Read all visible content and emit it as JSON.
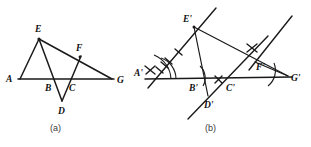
{
  "figure": {
    "background_color": "#ffffff",
    "ink_color": "#1a1a1a",
    "panels": [
      {
        "id": "panel-a",
        "caption": "(a)",
        "caption_x": 57,
        "caption_y": 131,
        "points": [
          {
            "name": "A",
            "label": "A",
            "x": 20,
            "y": 79,
            "label_x": 6,
            "label_y": 82
          },
          {
            "name": "B",
            "label": "B",
            "x": 51,
            "y": 79,
            "label_x": 45,
            "label_y": 91
          },
          {
            "name": "C",
            "label": "C",
            "x": 74,
            "y": 79,
            "label_x": 69,
            "label_y": 91
          },
          {
            "name": "D",
            "label": "D",
            "x": 62,
            "y": 100,
            "label_x": 58,
            "label_y": 114
          },
          {
            "name": "E",
            "label": "E",
            "x": 39,
            "y": 39,
            "label_x": 35,
            "label_y": 32
          },
          {
            "name": "F",
            "label": "F",
            "x": 80,
            "y": 57,
            "label_x": 76,
            "label_y": 51
          },
          {
            "name": "G",
            "label": "G",
            "x": 112,
            "y": 79,
            "label_x": 117,
            "label_y": 83
          }
        ],
        "segments": [
          {
            "name": "A-E",
            "from": "A",
            "to": "E"
          },
          {
            "name": "A-G",
            "from": "A",
            "to": "G"
          },
          {
            "name": "E-G",
            "from": "E",
            "to": "G"
          },
          {
            "name": "E-D",
            "from": "E",
            "to": "D"
          },
          {
            "name": "D-F",
            "from": "D",
            "to": "F"
          }
        ]
      },
      {
        "id": "panel-b",
        "caption": "(b)",
        "caption_x": 212,
        "caption_y": 131,
        "points": [
          {
            "name": "A-prime",
            "label": "A'",
            "x": 155,
            "y": 79,
            "label_x": 136,
            "label_y": 74
          },
          {
            "name": "B-prime",
            "label": "B'",
            "x": 197,
            "y": 79,
            "label_x": 190,
            "label_y": 91
          },
          {
            "name": "C-prime",
            "label": "C'",
            "x": 232,
            "y": 79,
            "label_x": 227,
            "label_y": 91
          },
          {
            "name": "D-prime",
            "label": "D'",
            "x": 208,
            "y": 95,
            "label_x": 205,
            "label_y": 108
          },
          {
            "name": "E-prime",
            "label": "E'",
            "x": 194,
            "y": 27,
            "label_x": 184,
            "label_y": 22
          },
          {
            "name": "F-prime",
            "label": "F'",
            "x": 255,
            "y": 62,
            "label_x": 257,
            "label_y": 70
          },
          {
            "name": "G-prime",
            "label": "G'",
            "x": 285,
            "y": 77,
            "label_x": 290,
            "label_y": 81
          }
        ],
        "segments": [
          {
            "name": "Aprime-Eprime",
            "from": "A-prime",
            "to": "E-prime"
          },
          {
            "name": "Aprime-Gprime",
            "from": "A-prime",
            "to": "G-prime"
          },
          {
            "name": "Eprime-Gprime",
            "from": "E-prime",
            "to": "G-prime"
          },
          {
            "name": "Eprime-Dprime",
            "from": "E-prime",
            "to": "D-prime"
          },
          {
            "name": "Dprime-Fprime",
            "from": "D-prime",
            "to": "F-prime"
          }
        ],
        "construction_marks": {
          "single_tick_on_AE": 1,
          "double_tick_on_AE": 2,
          "cross_tick_near_Aprime": 1,
          "cross_tick_between_Bprime_Cprime": 1,
          "cross_tick_near_Fprime": 1,
          "angle_arcs": 3,
          "extended_rays": 3
        }
      }
    ]
  }
}
